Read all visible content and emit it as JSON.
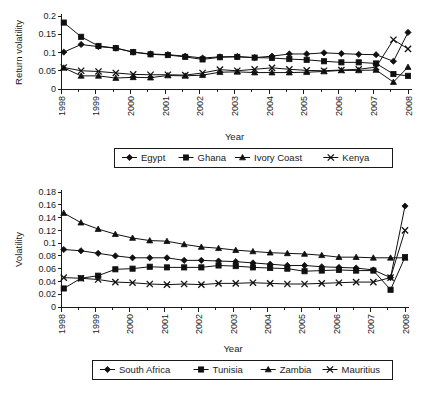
{
  "figure": {
    "background": "#ffffff",
    "ink_color": "#101010"
  },
  "chart_data": [
    {
      "id": "top",
      "type": "line",
      "title": "",
      "xlabel": "Year",
      "ylabel": "Return volatility",
      "grid": false,
      "legend_position": "bottom",
      "xlim": [
        1998,
        2008
      ],
      "ylim": [
        0,
        0.2
      ],
      "yticks": [
        0,
        0.05,
        0.1,
        0.15,
        0.2
      ],
      "ytick_labels": [
        "0",
        "0.05",
        "0.1",
        "0.15",
        "0.2"
      ],
      "xticks": [
        1998,
        1999,
        2000,
        2001,
        2002,
        2003,
        2004,
        2005,
        2006,
        2007,
        2008
      ],
      "xtick_labels": [
        "1998",
        "1999",
        "2000",
        "2001",
        "2002",
        "2003",
        "2004",
        "2005",
        "2006",
        "2007",
        "2008"
      ],
      "minor_xticks": [
        1998.5,
        1999.5,
        2000.5,
        2001.5,
        2002.5,
        2003.5,
        2004.5,
        2005.5,
        2006.5,
        2007.5
      ],
      "x": [
        1998.08,
        1998.58,
        1999.08,
        1999.58,
        2000.08,
        2000.58,
        2001.08,
        2001.58,
        2002.08,
        2002.58,
        2003.08,
        2003.58,
        2004.08,
        2004.58,
        2005.08,
        2005.58,
        2006.08,
        2006.58,
        2007.08,
        2007.58,
        2008.0
      ],
      "series": [
        {
          "name": "Egypt",
          "marker": "diamond",
          "values": [
            0.101,
            0.122,
            0.116,
            0.112,
            0.101,
            0.096,
            0.094,
            0.09,
            0.085,
            0.088,
            0.089,
            0.086,
            0.09,
            0.096,
            0.096,
            0.099,
            0.097,
            0.095,
            0.094,
            0.076,
            0.155
          ]
        },
        {
          "name": "Ghana",
          "marker": "square",
          "values": [
            0.182,
            0.143,
            0.118,
            0.112,
            0.101,
            0.095,
            0.093,
            0.088,
            0.081,
            0.087,
            0.088,
            0.086,
            0.085,
            0.082,
            0.08,
            0.076,
            0.073,
            0.073,
            0.07,
            0.041,
            0.036
          ]
        },
        {
          "name": "Ivory Coast",
          "marker": "triangle",
          "values": [
            0.058,
            0.036,
            0.036,
            0.03,
            0.032,
            0.031,
            0.037,
            0.036,
            0.038,
            0.046,
            0.047,
            0.045,
            0.045,
            0.045,
            0.046,
            0.048,
            0.051,
            0.051,
            0.052,
            0.019,
            0.06
          ]
        },
        {
          "name": "Kenya",
          "marker": "cross",
          "values": [
            0.059,
            0.05,
            0.048,
            0.044,
            0.04,
            0.039,
            0.039,
            0.038,
            0.044,
            0.053,
            0.05,
            0.054,
            0.058,
            0.054,
            0.051,
            0.05,
            0.052,
            0.054,
            0.06,
            0.135,
            0.11
          ]
        }
      ]
    },
    {
      "id": "bottom",
      "type": "line",
      "title": "",
      "xlabel": "Year",
      "ylabel": "Volatility",
      "grid": false,
      "legend_position": "bottom",
      "xlim": [
        1998,
        2008
      ],
      "ylim": [
        0,
        0.18
      ],
      "yticks": [
        0,
        0.02,
        0.04,
        0.06,
        0.08,
        0.1,
        0.12,
        0.14,
        0.16,
        0.18
      ],
      "ytick_labels": [
        "0",
        "0.02",
        "0.04",
        "0.06",
        "0.08",
        "0.1",
        "0.12",
        "0.14",
        "0.16",
        "0.18"
      ],
      "xticks": [
        1998,
        1999,
        2000,
        2001,
        2002,
        2003,
        2004,
        2005,
        2006,
        2007,
        2008
      ],
      "xtick_labels": [
        "1998",
        "1999",
        "2000",
        "2001",
        "2002",
        "2003",
        "2004",
        "2005",
        "2006",
        "2007",
        "2008"
      ],
      "minor_xticks": [
        1998.5,
        1999.5,
        2000.5,
        2001.5,
        2002.5,
        2003.5,
        2004.5,
        2005.5,
        2006.5,
        2007.5
      ],
      "x": [
        1998.08,
        1998.58,
        1999.08,
        1999.58,
        2000.08,
        2000.58,
        2001.08,
        2001.58,
        2002.08,
        2002.58,
        2003.08,
        2003.58,
        2004.08,
        2004.58,
        2005.08,
        2005.58,
        2006.08,
        2006.58,
        2007.08,
        2007.58,
        2008.0
      ],
      "series": [
        {
          "name": "South Africa",
          "marker": "diamond",
          "values": [
            0.09,
            0.088,
            0.084,
            0.08,
            0.077,
            0.077,
            0.077,
            0.073,
            0.073,
            0.072,
            0.071,
            0.069,
            0.067,
            0.065,
            0.065,
            0.063,
            0.062,
            0.061,
            0.058,
            0.046,
            0.158
          ]
        },
        {
          "name": "Tunisia",
          "marker": "square",
          "values": [
            0.029,
            0.045,
            0.049,
            0.059,
            0.06,
            0.063,
            0.062,
            0.062,
            0.062,
            0.065,
            0.064,
            0.062,
            0.061,
            0.06,
            0.056,
            0.057,
            0.058,
            0.057,
            0.057,
            0.027,
            0.078
          ]
        },
        {
          "name": "Zambia",
          "marker": "triangle",
          "values": [
            0.147,
            0.132,
            0.122,
            0.114,
            0.108,
            0.104,
            0.103,
            0.098,
            0.094,
            0.092,
            0.089,
            0.087,
            0.085,
            0.084,
            0.083,
            0.081,
            0.078,
            0.078,
            0.077,
            0.077,
            0.077
          ]
        },
        {
          "name": "Mauritius",
          "marker": "cross",
          "values": [
            0.046,
            0.045,
            0.043,
            0.039,
            0.038,
            0.036,
            0.035,
            0.036,
            0.035,
            0.037,
            0.037,
            0.038,
            0.037,
            0.036,
            0.036,
            0.037,
            0.038,
            0.039,
            0.039,
            0.046,
            0.12
          ]
        }
      ]
    }
  ]
}
